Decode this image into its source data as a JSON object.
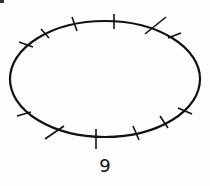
{
  "figure": {
    "label": "9",
    "stroke_color": "#111111",
    "background": "#fdfdfd",
    "ellipse": {
      "cx": 105,
      "cy": 79,
      "rx": 95,
      "ry": 58
    },
    "tick_count": 12,
    "ticks": [
      {
        "x1": 19,
        "y1": 42,
        "x2": 33,
        "y2": 47
      },
      {
        "x1": 41,
        "y1": 29,
        "x2": 49,
        "y2": 38
      },
      {
        "x1": 72,
        "y1": 17,
        "x2": 77,
        "y2": 31
      },
      {
        "x1": 114,
        "y1": 14,
        "x2": 114,
        "y2": 29
      },
      {
        "x1": 145,
        "y1": 34,
        "x2": 166,
        "y2": 17
      },
      {
        "x1": 168,
        "y1": 38,
        "x2": 181,
        "y2": 33
      },
      {
        "x1": 17,
        "y1": 116,
        "x2": 31,
        "y2": 112
      },
      {
        "x1": 45,
        "y1": 139,
        "x2": 64,
        "y2": 126
      },
      {
        "x1": 96,
        "y1": 129,
        "x2": 96,
        "y2": 149
      },
      {
        "x1": 133,
        "y1": 126,
        "x2": 139,
        "y2": 140
      },
      {
        "x1": 160,
        "y1": 116,
        "x2": 168,
        "y2": 128
      },
      {
        "x1": 178,
        "y1": 108,
        "x2": 192,
        "y2": 114
      }
    ]
  }
}
